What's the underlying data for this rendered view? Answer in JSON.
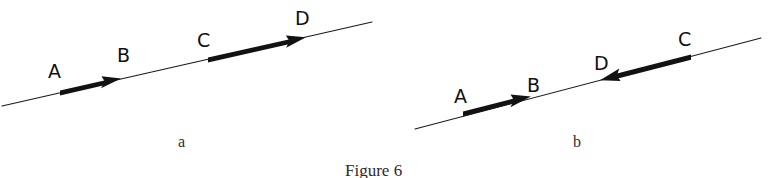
{
  "figure": {
    "caption": "Figure 6",
    "caption_position": {
      "x": 345,
      "y": 176
    },
    "background_color": "#ffffff",
    "ink_color": "#121212",
    "panels": [
      {
        "id": "panel-a",
        "sublabel": "a",
        "sublabel_position": {
          "x": 178,
          "y": 147
        },
        "axis_line": {
          "x1": 2,
          "y1": 106,
          "x2": 372,
          "y2": 22
        },
        "vectors": [
          {
            "name": "vector-AB",
            "from_label": "A",
            "to_label": "B",
            "direction": "right",
            "tail": {
              "x": 60,
              "y": 93
            },
            "head": {
              "x": 120,
              "y": 79
            }
          },
          {
            "name": "vector-CD",
            "from_label": "C",
            "to_label": "D",
            "direction": "right",
            "tail": {
              "x": 208,
              "y": 60
            },
            "head": {
              "x": 305,
              "y": 38
            }
          }
        ],
        "labels": [
          {
            "text": "A",
            "x": 48,
            "y": 78
          },
          {
            "text": "B",
            "x": 117,
            "y": 62
          },
          {
            "text": "C",
            "x": 197,
            "y": 47
          },
          {
            "text": "D",
            "x": 295,
            "y": 25
          }
        ]
      },
      {
        "id": "panel-b",
        "sublabel": "b",
        "sublabel_position": {
          "x": 573,
          "y": 147
        },
        "axis_line": {
          "x1": 415,
          "y1": 129,
          "x2": 761,
          "y2": 38
        },
        "vectors": [
          {
            "name": "vector-AB",
            "from_label": "A",
            "to_label": "B",
            "direction": "right",
            "tail": {
              "x": 463,
              "y": 114
            },
            "head": {
              "x": 530,
              "y": 97
            }
          },
          {
            "name": "vector-CD",
            "from_label": "C",
            "to_label": "D",
            "direction": "left",
            "tail": {
              "x": 691,
              "y": 57
            },
            "head": {
              "x": 601,
              "y": 80
            }
          }
        ],
        "labels": [
          {
            "text": "A",
            "x": 454,
            "y": 103
          },
          {
            "text": "B",
            "x": 527,
            "y": 92
          },
          {
            "text": "D",
            "x": 594,
            "y": 70
          },
          {
            "text": "C",
            "x": 678,
            "y": 46
          }
        ]
      }
    ]
  }
}
